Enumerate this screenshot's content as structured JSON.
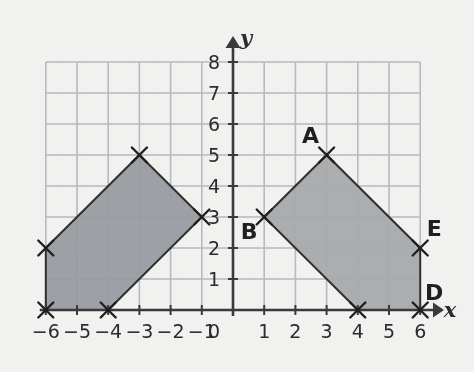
{
  "figure": {
    "background_color": "#f4f4f2",
    "grid_color": "#b9bcc0",
    "axis_color": "#3a3a3a",
    "x_axis_label": "x",
    "y_axis_label": "y",
    "origin_label": "0"
  },
  "chart_data": {
    "type": "scatter",
    "title": "",
    "xlabel": "x",
    "ylabel": "y",
    "xlim": [
      -6,
      6
    ],
    "ylim": [
      0,
      8
    ],
    "grid": true,
    "legend": "none",
    "x_ticks": [
      "-6",
      "-5",
      "-4",
      "-3",
      "-2",
      "-1",
      "0",
      "1",
      "2",
      "3",
      "4",
      "5",
      "6"
    ],
    "x_tick_values": [
      -6,
      -5,
      -4,
      -3,
      -2,
      -1,
      0,
      1,
      2,
      3,
      4,
      5,
      6
    ],
    "y_ticks": [
      "1",
      "2",
      "3",
      "4",
      "5",
      "6",
      "7",
      "8"
    ],
    "y_tick_values": [
      1,
      2,
      3,
      4,
      5,
      6,
      7,
      8
    ],
    "shapes": [
      {
        "name": "left-pentagon",
        "fill": "#9a9da1",
        "stroke": "#2f2f2f",
        "vertices": [
          {
            "x": -6,
            "y": 2,
            "label": ""
          },
          {
            "x": -3,
            "y": 5,
            "label": ""
          },
          {
            "x": -1,
            "y": 3,
            "label": ""
          },
          {
            "x": -4,
            "y": 0,
            "label": ""
          },
          {
            "x": -6,
            "y": 0,
            "label": ""
          }
        ]
      },
      {
        "name": "right-pentagon",
        "fill": "#a9abad",
        "stroke": "#2f2f2f",
        "vertices": [
          {
            "x": 1,
            "y": 3,
            "label": "B"
          },
          {
            "x": 3,
            "y": 5,
            "label": "A"
          },
          {
            "x": 6,
            "y": 2,
            "label": "E"
          },
          {
            "x": 6,
            "y": 0,
            "label": "D"
          },
          {
            "x": 4,
            "y": 0,
            "label": ""
          }
        ]
      }
    ],
    "point_labels": [
      {
        "text": "A",
        "x": 3,
        "y": 5
      },
      {
        "text": "B",
        "x": 1,
        "y": 3
      },
      {
        "text": "D",
        "x": 6,
        "y": 0
      },
      {
        "text": "E",
        "x": 6,
        "y": 2
      }
    ]
  }
}
